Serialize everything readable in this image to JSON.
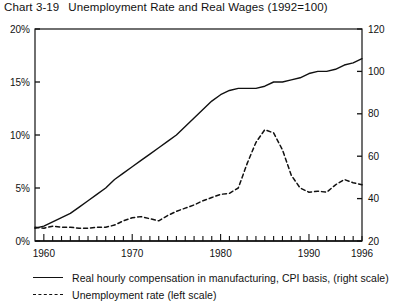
{
  "title": {
    "number": "Chart 3-19",
    "text": "Unemployment Rate and Real Wages (1992=100)"
  },
  "legend": [
    {
      "marker": "solid-line",
      "label": "Real hourly compensation in manufacturing, CPI basis, (right scale)"
    },
    {
      "marker": "dashed-line",
      "label": "Unemployment rate (left scale)"
    }
  ],
  "axes": {
    "left": {
      "labels": [
        "0%",
        "5%",
        "10%",
        "15%",
        "20%"
      ],
      "values": [
        0,
        5,
        10,
        15,
        20
      ]
    },
    "right": {
      "labels": [
        "20",
        "40",
        "60",
        "80",
        "100",
        "120"
      ],
      "values": [
        20,
        40,
        60,
        80,
        100,
        120
      ]
    },
    "x": {
      "labels": [
        "1960",
        "1970",
        "1980",
        "1990",
        "1996"
      ],
      "values": [
        1960,
        1970,
        1980,
        1990,
        1996
      ]
    }
  },
  "chart_data": {
    "type": "line",
    "xlabel": "",
    "ylabel": "",
    "xlim": [
      1959,
      1996
    ],
    "ylim_left": [
      0,
      20
    ],
    "ylim_right": [
      20,
      120
    ],
    "grid": false,
    "legend_position": "below",
    "x": [
      1959,
      1960,
      1961,
      1962,
      1963,
      1964,
      1965,
      1966,
      1967,
      1968,
      1969,
      1970,
      1971,
      1972,
      1973,
      1974,
      1975,
      1976,
      1977,
      1978,
      1979,
      1980,
      1981,
      1982,
      1983,
      1984,
      1985,
      1986,
      1987,
      1988,
      1989,
      1990,
      1991,
      1992,
      1993,
      1994,
      1995,
      1996
    ],
    "series": [
      {
        "name": "Real hourly compensation in manufacturing, CPI basis, (right scale)",
        "axis": "right",
        "style": "solid",
        "units": "index, 1992=100",
        "values": [
          26,
          27,
          29,
          31,
          33,
          36,
          39,
          42,
          45,
          49,
          52,
          55,
          58,
          61,
          64,
          67,
          70,
          74,
          78,
          82,
          86,
          89,
          91,
          92,
          92,
          92,
          93,
          95,
          95,
          96,
          97,
          99,
          100,
          100,
          101,
          103,
          104,
          106
        ]
      },
      {
        "name": "Unemployment rate (left scale)",
        "axis": "left",
        "style": "dashed",
        "units": "percent",
        "values": [
          1.3,
          1.2,
          1.4,
          1.3,
          1.3,
          1.2,
          1.2,
          1.3,
          1.3,
          1.5,
          1.9,
          2.2,
          2.3,
          2.1,
          1.9,
          2.4,
          2.8,
          3.1,
          3.4,
          3.8,
          4.1,
          4.4,
          4.5,
          5.0,
          7.3,
          9.3,
          10.5,
          10.2,
          8.6,
          6.2,
          5.0,
          4.6,
          4.7,
          4.6,
          5.3,
          5.8,
          5.5,
          5.3
        ]
      }
    ]
  },
  "style": {
    "line_color": "#111111",
    "axis_color": "#111111",
    "background": "#ffffff"
  }
}
